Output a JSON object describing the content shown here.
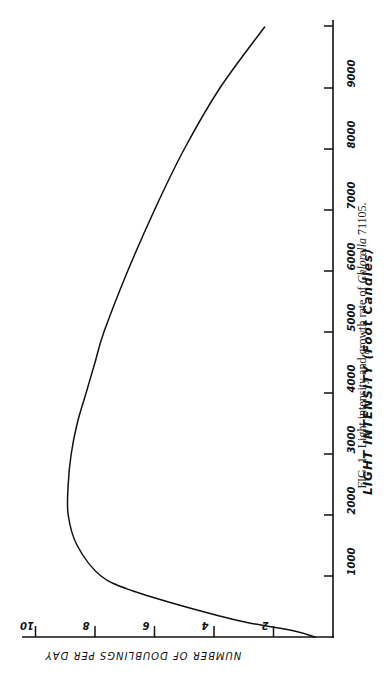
{
  "chart_data": {
    "type": "line",
    "title": "",
    "orientation": "rotated 90 degrees clockwise (x-axis drawn vertically on right, y-axis drawn horizontally along bottom)",
    "xlabel": "LIGHT INTENSITY (Foot Candles)",
    "ylabel": "NUMBER OF DOUBLINGS PER DAY",
    "x_ticks": [
      1000,
      2000,
      3000,
      4000,
      5000,
      6000,
      7000,
      8000,
      9000
    ],
    "y_ticks": [
      2,
      4,
      6,
      8,
      10
    ],
    "xlim": [
      0,
      10500
    ],
    "ylim": [
      0,
      10
    ],
    "grid": false,
    "legend": null,
    "series": [
      {
        "name": "Chlorella 71105 growth rate",
        "x": [
          100,
          250,
          500,
          750,
          1000,
          1500,
          2000,
          2500,
          3000,
          3500,
          4000,
          4500,
          5000,
          6000,
          7000,
          8000,
          9000,
          10000
        ],
        "values": [
          1.3,
          3.0,
          5.0,
          6.7,
          7.8,
          8.6,
          8.9,
          8.9,
          8.8,
          8.6,
          8.3,
          8.0,
          7.7,
          6.9,
          6.0,
          5.0,
          3.8,
          2.3
        ]
      }
    ],
    "caption": "FIG. 1. Light intensity and growth rate of Chlorella 71105."
  },
  "labels": {
    "x_axis_title": "LIGHT INTENSITY (Foot Candles)",
    "y_axis_title": "NUMBER OF DOUBLINGS PER DAY",
    "caption_prefix": "FIG. 1.",
    "caption_text": "Light intensity and growth rate of ",
    "caption_species": "Chlorella",
    "caption_strain": " 71105.",
    "x_tick_labels": [
      "1000",
      "2000",
      "3000",
      "4000",
      "5000",
      "6000",
      "7000",
      "8000",
      "9000"
    ],
    "y_tick_labels": [
      "2",
      "4",
      "6",
      "8",
      "10"
    ]
  },
  "colors": {
    "line": "#111111",
    "axis": "#111111",
    "background": "#ffffff"
  }
}
